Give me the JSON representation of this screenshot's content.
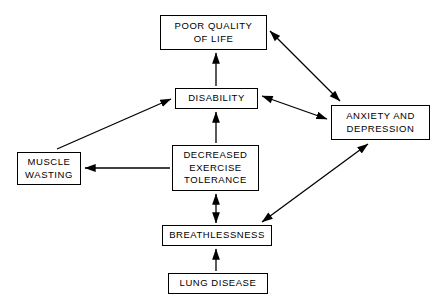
{
  "diagram": {
    "type": "flow-diagram",
    "background_color": "#ffffff",
    "line_color": "#000000",
    "text_color": "#000000",
    "nodes": [
      {
        "id": "poor-quality-of-life",
        "label": "POOR QUALITY\nOF LIFE",
        "x": 160,
        "y": 15,
        "width": 107,
        "height": 35
      },
      {
        "id": "disability",
        "label": "DISABILITY",
        "x": 175,
        "y": 88,
        "width": 83,
        "height": 21
      },
      {
        "id": "anxiety-and-depression",
        "label": "ANXIETY AND\nDEPRESSION",
        "x": 331,
        "y": 105,
        "width": 99,
        "height": 35
      },
      {
        "id": "muscle-wasting",
        "label": "MUSCLE\nWASTING",
        "x": 17,
        "y": 152,
        "width": 64,
        "height": 33
      },
      {
        "id": "decreased-exercise-tolerance",
        "label": "DECREASED\nEXERCISE\nTOLERANCE",
        "x": 172,
        "y": 145,
        "width": 87,
        "height": 46
      },
      {
        "id": "breathlessness",
        "label": "BREATHLESSNESS",
        "x": 162,
        "y": 225,
        "width": 110,
        "height": 21
      },
      {
        "id": "lung-disease",
        "label": "LUNG DISEASE",
        "x": 168,
        "y": 273,
        "width": 100,
        "height": 21
      }
    ],
    "edges": [
      {
        "id": "disability-to-poor-quality-of-life",
        "from": "disability",
        "to": "poor-quality-of-life",
        "x1": 216,
        "y1": 86,
        "x2": 216,
        "y2": 53,
        "heads": "end"
      },
      {
        "id": "poor-quality-of-life-and-anxiety-depression",
        "from": "poor-quality-of-life",
        "to": "anxiety-and-depression",
        "x1": 270,
        "y1": 31,
        "x2": 340,
        "y2": 101,
        "heads": "both"
      },
      {
        "id": "disability-and-anxiety-depression",
        "from": "disability",
        "to": "anxiety-and-depression",
        "x1": 262,
        "y1": 96,
        "x2": 327,
        "y2": 119,
        "heads": "both"
      },
      {
        "id": "decreased-exercise-tolerance-to-disability",
        "from": "decreased-exercise-tolerance",
        "to": "disability",
        "x1": 216,
        "y1": 143,
        "x2": 216,
        "y2": 112,
        "heads": "end"
      },
      {
        "id": "muscle-wasting-to-disability",
        "from": "muscle-wasting",
        "to": "disability",
        "x1": 57,
        "y1": 149,
        "x2": 171,
        "y2": 99,
        "heads": "end"
      },
      {
        "id": "decreased-exercise-tolerance-to-muscle-wasting",
        "from": "decreased-exercise-tolerance",
        "to": "muscle-wasting",
        "x1": 170,
        "y1": 168,
        "x2": 85,
        "y2": 168,
        "heads": "end"
      },
      {
        "id": "breathlessness-and-decreased-exercise-tolerance",
        "from": "breathlessness",
        "to": "decreased-exercise-tolerance",
        "x1": 216,
        "y1": 223,
        "x2": 216,
        "y2": 194,
        "heads": "both"
      },
      {
        "id": "breathlessness-and-anxiety-depression",
        "from": "breathlessness",
        "to": "anxiety-and-depression",
        "x1": 262,
        "y1": 222,
        "x2": 368,
        "y2": 144,
        "heads": "both"
      },
      {
        "id": "lung-disease-to-breathlessness",
        "from": "lung-disease",
        "to": "breathlessness",
        "x1": 216,
        "y1": 271,
        "x2": 216,
        "y2": 249,
        "heads": "end"
      }
    ]
  }
}
